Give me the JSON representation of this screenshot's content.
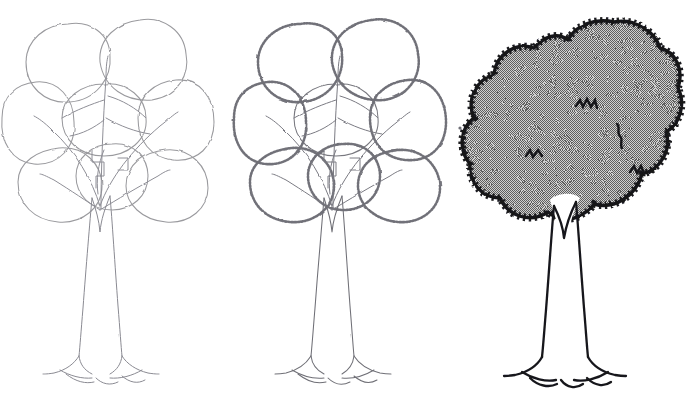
{
  "figure": {
    "title": "Tree Drawing — Three Progressive Stages",
    "background_color": "#ffffff",
    "width": 696,
    "height": 414,
    "panel_count": 3,
    "medium": "pencil and ink line drawing"
  },
  "palette": {
    "background": "#ffffff",
    "pencil_light": "#9a9a9e",
    "pencil_mid": "#6f6f76",
    "pencil_dark": "#4a4a52",
    "ink_black": "#16161a",
    "halftone_gray": "#9c9c9c",
    "halftone_dot": "#5f5f5f"
  },
  "panels": [
    {
      "index": 1,
      "name": "stage-1-blob-construction",
      "label": "Stage 1 — light pencil blob construction",
      "description": "Loose light-pencil outlines of overlapping foliage masses plus branch lines and trunk",
      "stroke_color": "#9a9a9e",
      "stroke_width": 1.0,
      "fill": "none",
      "has_serration": false,
      "has_shading": false,
      "origin_x": 0
    },
    {
      "index": 2,
      "name": "stage-2-serrated-edges",
      "label": "Stage 2 — serrated leaf edges added",
      "description": "Same blob construction with jagged zigzag leaf-edge texture drawn along every foliage outline",
      "stroke_color": "#6f6f76",
      "stroke_width": 1.1,
      "fill": "none",
      "has_serration": true,
      "has_shading": false,
      "origin_x": 232
    },
    {
      "index": 3,
      "name": "stage-3-inked-and-shaded",
      "label": "Stage 3 — inked outline with halftone shading",
      "description": "Bold black jagged canopy silhouette filled with 50% halftone dither gray, interior zigzag accent marks, clean trunk and root flare",
      "stroke_color": "#16161a",
      "stroke_width": 3.2,
      "fill": "#9c9c9c",
      "has_serration": true,
      "has_shading": true,
      "origin_x": 464
    }
  ],
  "tree_geometry": {
    "canopy": {
      "top_y": 22,
      "bottom_y": 226,
      "left_x": 2,
      "right_x": 210,
      "center_x": 104,
      "notch_top_x": 104,
      "notch_top_y": 40
    },
    "trunk": {
      "top_y": 200,
      "base_y": 356,
      "center_x": 100,
      "top_width": 20,
      "base_width": 34,
      "fork_depth": 38
    },
    "roots": {
      "ground_y": 374,
      "left_x": 52,
      "right_x": 152,
      "arc_count": 3
    },
    "blobs": [
      {
        "name": "blob-top-left",
        "cx": 68,
        "cy": 62,
        "rx": 42,
        "ry": 40
      },
      {
        "name": "blob-top-right",
        "cx": 140,
        "cy": 58,
        "rx": 44,
        "ry": 38
      },
      {
        "name": "blob-mid-left",
        "cx": 36,
        "cy": 122,
        "rx": 36,
        "ry": 42
      },
      {
        "name": "blob-mid-center",
        "cx": 104,
        "cy": 118,
        "rx": 40,
        "ry": 36
      },
      {
        "name": "blob-mid-right",
        "cx": 176,
        "cy": 118,
        "rx": 38,
        "ry": 42
      },
      {
        "name": "blob-low-left",
        "cx": 60,
        "cy": 184,
        "rx": 42,
        "ry": 38
      },
      {
        "name": "blob-low-center",
        "cx": 112,
        "cy": 176,
        "rx": 36,
        "ry": 34
      },
      {
        "name": "blob-low-right",
        "cx": 166,
        "cy": 186,
        "rx": 42,
        "ry": 36
      }
    ],
    "branches": [
      {
        "name": "branch-left-upper",
        "from": [
          100,
          200
        ],
        "to": [
          40,
          120
        ]
      },
      {
        "name": "branch-right-upper",
        "from": [
          100,
          200
        ],
        "to": [
          172,
          112
        ]
      },
      {
        "name": "branch-center",
        "from": [
          100,
          200
        ],
        "to": [
          106,
          60
        ]
      },
      {
        "name": "branch-left-low",
        "from": [
          100,
          205
        ],
        "to": [
          48,
          176
        ]
      },
      {
        "name": "branch-right-low",
        "from": [
          100,
          205
        ],
        "to": [
          164,
          172
        ]
      }
    ],
    "interior_marks": [
      {
        "name": "zigzag-mark-upper",
        "x": 122,
        "y": 104,
        "type": "zigzag"
      },
      {
        "name": "zigzag-mark-right",
        "x": 155,
        "y": 130,
        "type": "squiggle"
      },
      {
        "name": "zigzag-mark-left",
        "x": 70,
        "y": 152,
        "type": "zigzag"
      },
      {
        "name": "zigzag-mark-lower-right",
        "x": 170,
        "y": 178,
        "type": "zigzag"
      }
    ]
  },
  "shading": {
    "pattern": "checkerboard-dither",
    "cell_size_px": 2,
    "effective_tone": "50% gray",
    "fill_hex": "#9c9c9c"
  }
}
